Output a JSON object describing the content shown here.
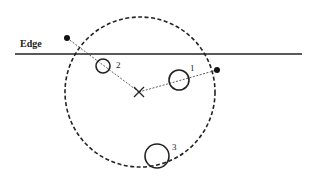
{
  "diagram": {
    "title": "",
    "edge": {
      "label": "Edge",
      "line": {
        "x1": 15,
        "y1": 54,
        "x2": 302,
        "y2": 54
      }
    },
    "boundary_circle": {
      "cx": 140,
      "cy": 92,
      "r": 75,
      "style": "dashed"
    },
    "center_marker": {
      "x": 139,
      "y": 92,
      "glyph": "x-mark"
    },
    "external_points": [
      {
        "id": "point-left",
        "x": 67,
        "y": 38
      },
      {
        "id": "point-right",
        "x": 217,
        "y": 70
      }
    ],
    "objects": [
      {
        "label": "1",
        "cx": 179,
        "cy": 80,
        "r": 10,
        "label_x": 190,
        "label_y": 71
      },
      {
        "label": "2",
        "cx": 103,
        "cy": 66,
        "r": 7,
        "label_x": 116,
        "label_y": 68
      },
      {
        "label": "3",
        "cx": 157,
        "cy": 156,
        "r": 12,
        "label_x": 172,
        "label_y": 150
      }
    ],
    "colors": {
      "line": "#222222",
      "background": "#ffffff"
    }
  }
}
